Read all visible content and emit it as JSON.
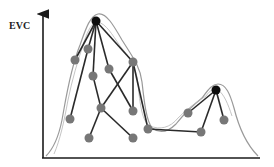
{
  "figure": {
    "y_axis_label": "EVC",
    "colors": {
      "axis": "#1a1a1a",
      "edge": "#2a2a2a",
      "envelope": "#9a9a9a",
      "gray_node": "#777777",
      "peak_node": "#0d0d0d"
    }
  },
  "nodes": [
    {
      "id": "peak1",
      "x": 96,
      "y": 21,
      "type": "peak"
    },
    {
      "id": "g1",
      "x": 75,
      "y": 60,
      "type": "gray"
    },
    {
      "id": "g2",
      "x": 88,
      "y": 49,
      "type": "gray"
    },
    {
      "id": "g3",
      "x": 93,
      "y": 76,
      "type": "gray"
    },
    {
      "id": "g4",
      "x": 109,
      "y": 69,
      "type": "gray"
    },
    {
      "id": "g5",
      "x": 133,
      "y": 62,
      "type": "gray"
    },
    {
      "id": "g6",
      "x": 70,
      "y": 119,
      "type": "gray"
    },
    {
      "id": "g7",
      "x": 101,
      "y": 108,
      "type": "gray"
    },
    {
      "id": "g8",
      "x": 133,
      "y": 111,
      "type": "gray"
    },
    {
      "id": "g9",
      "x": 89,
      "y": 138,
      "type": "gray"
    },
    {
      "id": "g10",
      "x": 133,
      "y": 138,
      "type": "gray"
    },
    {
      "id": "g11",
      "x": 148,
      "y": 129,
      "type": "gray"
    },
    {
      "id": "peak2",
      "x": 216,
      "y": 90,
      "type": "peak"
    },
    {
      "id": "g12",
      "x": 188,
      "y": 113,
      "type": "gray"
    },
    {
      "id": "g13",
      "x": 224,
      "y": 120,
      "type": "gray"
    },
    {
      "id": "g14",
      "x": 201,
      "y": 132,
      "type": "gray"
    }
  ],
  "edges": [
    [
      "peak1",
      "g1"
    ],
    [
      "peak1",
      "g2"
    ],
    [
      "peak1",
      "g3"
    ],
    [
      "peak1",
      "g4"
    ],
    [
      "peak1",
      "g5"
    ],
    [
      "g2",
      "g6"
    ],
    [
      "g3",
      "g7"
    ],
    [
      "g7",
      "g9"
    ],
    [
      "g7",
      "g10"
    ],
    [
      "g5",
      "g7"
    ],
    [
      "g5",
      "g8"
    ],
    [
      "g4",
      "g8"
    ],
    [
      "g5",
      "g11"
    ],
    [
      "g11",
      "g14"
    ],
    [
      "g14",
      "peak2"
    ],
    [
      "g12",
      "peak2"
    ],
    [
      "g13",
      "peak2"
    ]
  ]
}
